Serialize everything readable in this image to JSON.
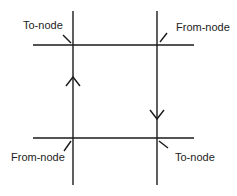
{
  "diagram": {
    "title": "",
    "colors": {
      "line": "#1a1a1a",
      "text": "#222222",
      "background": "#ffffff"
    },
    "labels": {
      "top_left": "To-node",
      "top_right": "From-node",
      "bottom_left": "From-node",
      "bottom_right": "To-node"
    },
    "arrows": {
      "left_vertical": "up",
      "right_vertical": "down"
    }
  }
}
